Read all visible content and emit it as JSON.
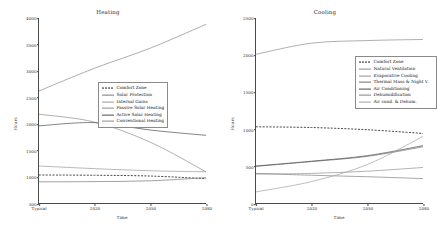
{
  "figure": {
    "background": "#ffffff",
    "width": 433,
    "height": 248
  },
  "chart_data": [
    {
      "type": "line",
      "title": "Heating",
      "xlabel": "Time",
      "ylabel": "Hours",
      "x": [
        "Typical",
        "2020",
        "2050",
        "2080"
      ],
      "xticklabels": [
        "Typical",
        "2020",
        "2050",
        "2080"
      ],
      "yticklabels": [
        "500",
        "1000",
        "1500",
        "2000",
        "2500",
        "3000",
        "3500",
        "4000"
      ],
      "ylim": [
        500,
        4000
      ],
      "ytick_values": [
        500,
        1000,
        1500,
        2000,
        2500,
        3000,
        3500,
        4000
      ],
      "grid": false,
      "legend_position": "center right",
      "series": [
        {
          "name": "Comfort Zone",
          "style": "dashed",
          "color": "#1a1a1a",
          "values": [
            1030,
            1025,
            1010,
            960
          ]
        },
        {
          "name": "Solar Protection",
          "style": "solid",
          "color": "#777777",
          "values": [
            900,
            905,
            920,
            980
          ]
        },
        {
          "name": "Internal Gains",
          "style": "solid",
          "color": "#999999",
          "values": [
            1200,
            1150,
            1110,
            1090
          ]
        },
        {
          "name": "Passive Solar Heating",
          "style": "solid",
          "color": "#8c8c8c",
          "values": [
            2180,
            2030,
            1650,
            1090
          ]
        },
        {
          "name": "Active Solar Heating",
          "style": "solid",
          "color": "#4d4d4d",
          "values": [
            1960,
            2020,
            1880,
            1780
          ]
        },
        {
          "name": "Conventional Heating",
          "style": "solid",
          "color": "#8a8a8a",
          "values": [
            2620,
            3050,
            3430,
            3880
          ]
        }
      ]
    },
    {
      "type": "line",
      "title": "Cooling",
      "xlabel": "Time",
      "ylabel": "Hours",
      "x": [
        "Typical",
        "2020",
        "2050",
        "2080"
      ],
      "xticklabels": [
        "Typical",
        "2020",
        "2050",
        "2080"
      ],
      "yticklabels": [
        "0",
        "500",
        "1000",
        "1500",
        "2000",
        "2500"
      ],
      "ylim": [
        0,
        2500
      ],
      "ytick_values": [
        0,
        500,
        1000,
        1500,
        2000,
        2500
      ],
      "grid": false,
      "legend_position": "upper right",
      "series": [
        {
          "name": "Comfort Zone",
          "style": "dashed",
          "color": "#1a1a1a",
          "values": [
            1030,
            1020,
            990,
            940
          ]
        },
        {
          "name": "Natural Ventilation",
          "style": "solid",
          "color": "#8c8c8c",
          "values": [
            2010,
            2160,
            2195,
            2210
          ]
        },
        {
          "name": "Evaporative Cooling",
          "style": "solid",
          "color": "#909090",
          "values": [
            390,
            400,
            430,
            480
          ]
        },
        {
          "name": "Thermal Mass & Night V.",
          "style": "solid",
          "color": "#6e6e6e",
          "values": [
            495,
            560,
            630,
            760
          ]
        },
        {
          "name": "Air Conditioning",
          "style": "solid",
          "color": "#4d4d4d",
          "values": [
            500,
            565,
            640,
            775
          ]
        },
        {
          "name": "Dehumidification",
          "style": "solid",
          "color": "#808080",
          "values": [
            400,
            375,
            355,
            330
          ]
        },
        {
          "name": "Air cond. & Dehum.",
          "style": "solid",
          "color": "#a0a0a0",
          "values": [
            150,
            290,
            520,
            900
          ]
        }
      ]
    }
  ]
}
